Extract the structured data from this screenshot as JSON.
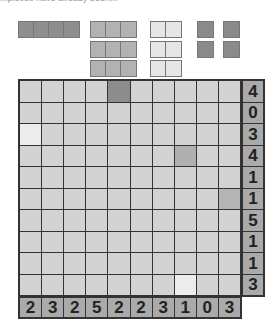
{
  "header": {
    "clipped_text": "...pieces have already been..."
  },
  "colors": {
    "cell_empty": "#d3d3d3",
    "cell_dark": "#8c8c8c",
    "cell_medium": "#b0b0b0",
    "cell_light": "#ececec",
    "clue_bg": "#aaaaaa",
    "piece_4": "#8e8e8e",
    "piece_3": "#b2b2b2",
    "piece_2": "#e6e6e6",
    "piece_1": "#8a8a8a"
  },
  "pieces": [
    {
      "size": 4,
      "x": 18,
      "y": 21,
      "color": "#8e8e8e"
    },
    {
      "size": 3,
      "x": 90,
      "y": 21,
      "color": "#b2b2b2"
    },
    {
      "size": 3,
      "x": 90,
      "y": 41,
      "color": "#b2b2b2"
    },
    {
      "size": 3,
      "x": 90,
      "y": 60,
      "color": "#b2b2b2"
    },
    {
      "size": 2,
      "x": 150,
      "y": 21,
      "color": "#e6e6e6"
    },
    {
      "size": 2,
      "x": 150,
      "y": 41,
      "color": "#e6e6e6"
    },
    {
      "size": 2,
      "x": 150,
      "y": 60,
      "color": "#e6e6e6"
    },
    {
      "size": 1,
      "x": 197,
      "y": 21,
      "color": "#8a8a8a"
    },
    {
      "size": 1,
      "x": 223,
      "y": 21,
      "color": "#8a8a8a"
    },
    {
      "size": 1,
      "x": 197,
      "y": 41,
      "color": "#8a8a8a"
    },
    {
      "size": 1,
      "x": 223,
      "y": 41,
      "color": "#8a8a8a"
    }
  ],
  "board": {
    "rows": 10,
    "cols": 10,
    "marked_cells": [
      {
        "row": 0,
        "col": 4,
        "color": "#8c8c8c"
      },
      {
        "row": 2,
        "col": 0,
        "color": "#ececec"
      },
      {
        "row": 3,
        "col": 7,
        "color": "#b0b0b0"
      },
      {
        "row": 5,
        "col": 9,
        "color": "#b4b4b4"
      },
      {
        "row": 9,
        "col": 7,
        "color": "#ececec"
      }
    ]
  },
  "row_clues": [
    "4",
    "0",
    "3",
    "4",
    "1",
    "1",
    "5",
    "1",
    "1",
    "3"
  ],
  "col_clues": [
    "2",
    "3",
    "2",
    "5",
    "2",
    "2",
    "3",
    "1",
    "0",
    "3"
  ]
}
